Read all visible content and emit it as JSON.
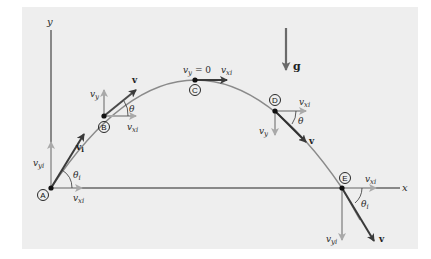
{
  "diagram": {
    "axes": {
      "x_label": "x",
      "y_label": "y"
    },
    "gravity": {
      "label": "g"
    },
    "points": [
      {
        "id": "A",
        "label": "A",
        "vector_label": "v",
        "vector_sub": "i",
        "angle": "θ",
        "angle_sub": "i",
        "vx": "v",
        "vx_sub": "xi",
        "vy": "v",
        "vy_sub": "yi"
      },
      {
        "id": "B",
        "label": "B",
        "vector_label": "v",
        "angle": "θ",
        "vx": "v",
        "vx_sub": "xi",
        "vy": "v",
        "vy_sub": "y"
      },
      {
        "id": "C",
        "label": "C",
        "vy_text": "v",
        "vy_sub": "y",
        "vy_value": " = 0",
        "vx": "v",
        "vx_sub": "xi"
      },
      {
        "id": "D",
        "label": "D",
        "vector_label": "v",
        "angle": "θ",
        "vx": "v",
        "vx_sub": "xi",
        "vy": "v",
        "vy_sub": "y"
      },
      {
        "id": "E",
        "label": "E",
        "vector_label": "v",
        "angle": "θ",
        "angle_sub": "i",
        "vx": "v",
        "vx_sub": "xi",
        "vy": "v",
        "vy_sub": "yi"
      }
    ],
    "colors": {
      "panel": "#eeeeee",
      "trajectory": "#8a8a8a",
      "component_arrow": "#a9a9a9",
      "velocity_arrow": "#3a3a3a",
      "axis": "#222222"
    }
  }
}
